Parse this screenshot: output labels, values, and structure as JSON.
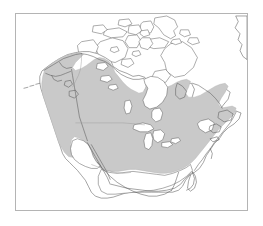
{
  "figure": {
    "kind": "range-map",
    "title": "",
    "caption": "",
    "width": 263,
    "height": 226,
    "background_color": "#ffffff"
  },
  "frame": {
    "x": 15,
    "y": 13,
    "width": 233,
    "height": 198,
    "border_color": "#b4b4b4",
    "border_width": 1,
    "fill_color": "#ffffff"
  },
  "map": {
    "region": "North America",
    "projection_hint": "conic",
    "outline_color": "#585858",
    "outline_width": 0.55,
    "internal_border_color": "#9a9a9a",
    "land_fill": "#ffffff",
    "water_fill": "#ffffff"
  },
  "range": {
    "label": "",
    "fill_color": "#c9c9c9",
    "stroke_color": "#b2b2b2",
    "included_regions": [
      "Alaska",
      "Yukon",
      "British Columbia",
      "Alberta",
      "Saskatchewan",
      "Manitoba",
      "southern Northwest Territories",
      "Ontario",
      "Quebec",
      "Labrador",
      "Atlantic Canada",
      "New England",
      "Mid-Atlantic United States",
      "Midwest United States",
      "Great Plains",
      "Pacific Northwest",
      "California coast ranges",
      "Rocky Mountains",
      "Appalachians",
      "southeastern United States interior"
    ],
    "excluded_regions": [
      "Canadian Arctic Archipelago",
      "Hudson Bay",
      "Great Lakes",
      "Great Basin",
      "Desert Southwest",
      "Gulf Coast",
      "Florida",
      "Mexico",
      "Baja California",
      "Greenland"
    ]
  },
  "legend": {
    "visible": false,
    "entries": []
  },
  "axes": {
    "visible": false,
    "tick_labels": []
  },
  "annotations": []
}
